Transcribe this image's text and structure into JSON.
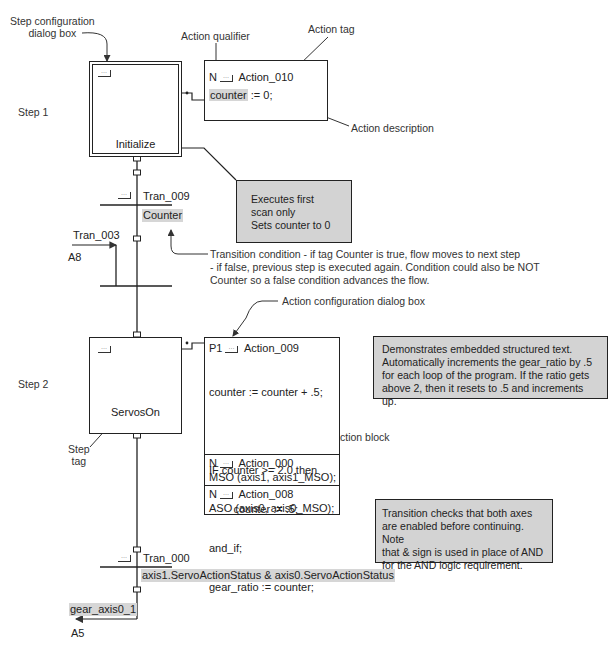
{
  "annotations": {
    "step_config_dialog": [
      "Step configuration",
      "dialog box"
    ],
    "action_qualifier": "Action qualifier",
    "action_tag": "Action tag",
    "action_description": "Action description",
    "action_config_dialog": "Action configuration dialog box",
    "action_block": "Action block",
    "step_tag": [
      "Step",
      "tag"
    ],
    "transition_condition": [
      "Transition condition - if tag Counter is true, flow moves to next step",
      "- if false, previous step is executed again. Condition could also be NOT",
      "Counter so a false condition advances the flow."
    ]
  },
  "step1": {
    "label": "Step 1",
    "name": "Initialize",
    "action": {
      "qualifier": "N",
      "tag": "Action_010",
      "code": "counter := 0;",
      "code_highlight": "counter",
      "code_rest": " := 0;"
    },
    "note": [
      "Executes first scan only",
      "Sets counter to 0"
    ]
  },
  "tran_009": {
    "name": "Tran_009",
    "condition": "Counter"
  },
  "tran_003": {
    "name": "Tran_003",
    "ref": "A8"
  },
  "step2": {
    "label": "Step 2",
    "name": "ServosOn",
    "actions": [
      {
        "qualifier": "P1",
        "tag": "Action_009",
        "code": [
          "counter := counter + .5;",
          "",
          "IF counter >= 2.0 then",
          "        counter := .5;",
          "and_if;",
          "gear_ratio := counter;"
        ]
      },
      {
        "qualifier": "N",
        "tag": "Action_000",
        "code": [
          "MSO (axis1, axis1_MSO);"
        ]
      },
      {
        "qualifier": "N",
        "tag": "Action_008",
        "code": [
          "ASO (axis0, axis0_MSO);"
        ]
      }
    ],
    "note": [
      "Demonstrates embedded structured text.",
      "Automatically increments the gear_ratio by .5",
      "for each loop of the program. If the ratio gets",
      "above 2, then it resets to .5 and increments up."
    ]
  },
  "tran_000": {
    "name": "Tran_000",
    "condition": "axis1.ServoActionStatus & axis0.ServoActionStatus",
    "note": [
      "Transition checks that both axes",
      "are enabled before continuing. Note",
      "that & sign is used in place of AND",
      "for the AND logic requirement."
    ]
  },
  "jump": {
    "tag": "gear_axis0_1",
    "ref": "A5"
  },
  "ellipsis_glyph": "···"
}
